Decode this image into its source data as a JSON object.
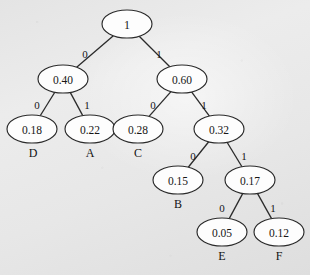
{
  "figure": {
    "background_color": "#e9e9e9",
    "stroke_color": "#2b2b2b",
    "node_fill_color": "#fdfdfd",
    "text_color": "#161616"
  },
  "chart_data": {
    "type": "diagram",
    "diagram_type": "binary-tree",
    "xlabel": "",
    "ylabel": "",
    "grid": false,
    "legend": null,
    "edge_label_values": [
      "0",
      "1"
    ],
    "nodes": [
      {
        "id": "n0",
        "value": "1",
        "symbol": "",
        "cx": 127,
        "cy": 24,
        "rx": 25,
        "ry": 14,
        "depth": 0
      },
      {
        "id": "n1",
        "value": "0.40",
        "symbol": "",
        "cx": 63,
        "cy": 79,
        "rx": 25,
        "ry": 14,
        "depth": 1
      },
      {
        "id": "n2",
        "value": "0.60",
        "symbol": "",
        "cx": 182,
        "cy": 79,
        "rx": 25,
        "ry": 14,
        "depth": 1
      },
      {
        "id": "n3",
        "value": "0.18",
        "symbol": "D",
        "cx": 32,
        "cy": 129,
        "rx": 25,
        "ry": 14,
        "depth": 2
      },
      {
        "id": "n4",
        "value": "0.22",
        "symbol": "A",
        "cx": 90,
        "cy": 129,
        "rx": 25,
        "ry": 14,
        "depth": 2
      },
      {
        "id": "n5",
        "value": "0.28",
        "symbol": "C",
        "cx": 138,
        "cy": 129,
        "rx": 25,
        "ry": 14,
        "depth": 2
      },
      {
        "id": "n6",
        "value": "0.32",
        "symbol": "",
        "cx": 219,
        "cy": 129,
        "rx": 25,
        "ry": 14,
        "depth": 2
      },
      {
        "id": "n7",
        "value": "0.15",
        "symbol": "B",
        "cx": 178,
        "cy": 180,
        "rx": 25,
        "ry": 14,
        "depth": 3
      },
      {
        "id": "n8",
        "value": "0.17",
        "symbol": "",
        "cx": 250,
        "cy": 180,
        "rx": 25,
        "ry": 14,
        "depth": 3
      },
      {
        "id": "n9",
        "value": "0.05",
        "symbol": "E",
        "cx": 222,
        "cy": 232,
        "rx": 25,
        "ry": 14,
        "depth": 4
      },
      {
        "id": "n10",
        "value": "0.12",
        "symbol": "F",
        "cx": 279,
        "cy": 232,
        "rx": 25,
        "ry": 14,
        "depth": 4
      }
    ],
    "edges": [
      {
        "from": "n0",
        "to": "n1",
        "label": "0",
        "lx": 85,
        "ly": 54
      },
      {
        "from": "n0",
        "to": "n2",
        "label": "1",
        "lx": 159,
        "ly": 54
      },
      {
        "from": "n1",
        "to": "n3",
        "label": "0",
        "lx": 37,
        "ly": 105
      },
      {
        "from": "n1",
        "to": "n4",
        "label": "1",
        "lx": 87,
        "ly": 105
      },
      {
        "from": "n2",
        "to": "n5",
        "label": "0",
        "lx": 153,
        "ly": 105
      },
      {
        "from": "n2",
        "to": "n6",
        "label": "1",
        "lx": 204,
        "ly": 105
      },
      {
        "from": "n6",
        "to": "n7",
        "label": "0",
        "lx": 193,
        "ly": 156
      },
      {
        "from": "n6",
        "to": "n8",
        "label": "1",
        "lx": 244,
        "ly": 156
      },
      {
        "from": "n8",
        "to": "n9",
        "label": "0",
        "lx": 222,
        "ly": 208
      },
      {
        "from": "n8",
        "to": "n10",
        "label": "1",
        "lx": 273,
        "ly": 208
      }
    ],
    "leaf_symbols": [
      {
        "symbol": "D",
        "probability": "0.18",
        "code": "00",
        "x": 33,
        "y": 153
      },
      {
        "symbol": "A",
        "probability": "0.22",
        "code": "01",
        "x": 90,
        "y": 153
      },
      {
        "symbol": "C",
        "probability": "0.28",
        "code": "10",
        "x": 138,
        "y": 153
      },
      {
        "symbol": "B",
        "probability": "0.15",
        "code": "110",
        "x": 178,
        "y": 204
      },
      {
        "symbol": "E",
        "probability": "0.05",
        "code": "1110",
        "x": 222,
        "y": 256
      },
      {
        "symbol": "F",
        "probability": "0.12",
        "code": "1111",
        "x": 279,
        "y": 256
      }
    ]
  }
}
